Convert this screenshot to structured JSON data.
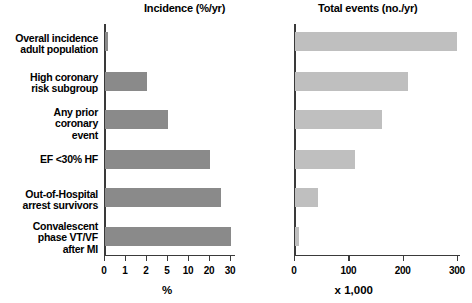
{
  "chart_data": [
    {
      "type": "bar",
      "orientation": "horizontal",
      "title": "Incidence (%/yr)",
      "xlabel": "%",
      "ylabel": "",
      "scale": "ordinal-log",
      "grid": false,
      "legend": null,
      "bar_color": "#8a8a8a",
      "tick_labels": [
        "0",
        "1",
        "2",
        "5",
        "10",
        "20",
        "30"
      ],
      "tick_values": [
        0,
        1,
        2,
        5,
        10,
        20,
        30
      ],
      "categories": [
        "Overall incidence adult population",
        "High coronary risk subgroup",
        "Any prior coronary event",
        "EF <30% HF",
        "Out-of-Hospital arrest survivors",
        "Convalescent phase VT/VF after MI"
      ],
      "values": [
        0.1,
        2,
        5,
        20,
        25,
        30
      ],
      "units": "%/yr"
    },
    {
      "type": "bar",
      "orientation": "horizontal",
      "title": "Total events (no./yr)",
      "xlabel": "x 1,000",
      "ylabel": "",
      "scale": "linear",
      "xlim": [
        0,
        300
      ],
      "grid": false,
      "legend": null,
      "bar_color": "#bfbfbf",
      "tick_labels": [
        "0",
        "100",
        "200",
        "300"
      ],
      "tick_values": [
        0,
        100,
        200,
        300
      ],
      "categories": [
        "Overall incidence adult population",
        "High coronary risk subgroup",
        "Any prior coronary event",
        "EF <30% HF",
        "Out-of-Hospital arrest survivors",
        "Convalescent phase VT/VF after MI"
      ],
      "values": [
        298,
        208,
        160,
        110,
        43,
        8
      ],
      "units": "x 1,000 events/yr"
    }
  ],
  "left_panel": {
    "title": "Incidence (%/yr)",
    "axis_caption": "%",
    "ticks": [
      "0",
      "1",
      "2",
      "5",
      "10",
      "20",
      "30"
    ]
  },
  "right_panel": {
    "title": "Total events (no./yr)",
    "axis_caption": "x 1,000",
    "ticks": [
      "0",
      "100",
      "200",
      "300"
    ]
  },
  "category_labels": [
    "Overall incidence\nadult population",
    "High coronary\nrisk subgroup",
    "Any prior\ncoronary\nevent",
    "EF <30% HF",
    "Out-of-Hospital\narrest survivors",
    "Convalescent\nphase VT/VF\nafter MI"
  ]
}
